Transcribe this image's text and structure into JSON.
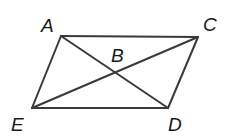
{
  "diagram": {
    "type": "geometry",
    "shape": "parallelogram with diagonals",
    "stroke_color": "#3a3a3a",
    "label_color": "#1a1a1a",
    "points": {
      "A": {
        "label": "A",
        "x": 61,
        "y": 36,
        "lx": 41,
        "ly": 32
      },
      "C": {
        "label": "C",
        "x": 198,
        "y": 37,
        "lx": 203,
        "ly": 31
      },
      "E": {
        "label": "E",
        "x": 32,
        "y": 108,
        "lx": 11,
        "ly": 131
      },
      "D": {
        "label": "D",
        "x": 168,
        "y": 108,
        "lx": 168,
        "ly": 131
      },
      "B": {
        "label": "B",
        "x": 115,
        "y": 72,
        "lx": 111,
        "ly": 62
      }
    },
    "segments": [
      {
        "name": "AC",
        "from": "A",
        "to": "C"
      },
      {
        "name": "CD",
        "from": "C",
        "to": "D"
      },
      {
        "name": "DE",
        "from": "D",
        "to": "E"
      },
      {
        "name": "EA",
        "from": "E",
        "to": "A"
      },
      {
        "name": "AD",
        "from": "A",
        "to": "D"
      },
      {
        "name": "EC",
        "from": "E",
        "to": "C"
      }
    ]
  }
}
